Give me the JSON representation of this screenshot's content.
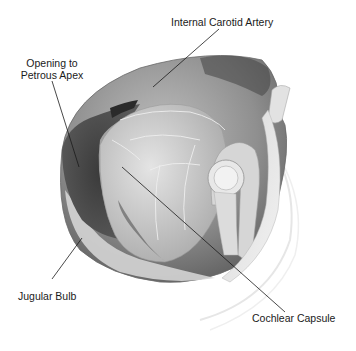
{
  "figure": {
    "type": "anatomical illustration",
    "labels": [
      {
        "id": "internal-carotid-artery",
        "text": "Internal Carotid Artery"
      },
      {
        "id": "opening-to-petrous-apex",
        "line1": "Opening to",
        "line2": "Petrous Apex"
      },
      {
        "id": "jugular-bulb",
        "text": "Jugular Bulb"
      },
      {
        "id": "cochlear-capsule",
        "text": "Cochlear Capsule"
      }
    ]
  }
}
